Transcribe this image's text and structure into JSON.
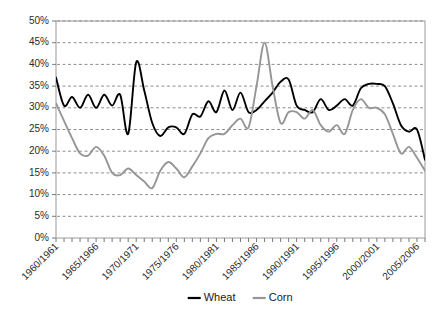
{
  "chart_data": {
    "type": "line",
    "title": "",
    "xlabel": "",
    "ylabel": "",
    "ylim": [
      0,
      50
    ],
    "y_tick_step": 5,
    "y_tick_labels": [
      "0%",
      "5%",
      "10%",
      "15%",
      "20%",
      "25%",
      "30%",
      "35%",
      "40%",
      "45%",
      "50%"
    ],
    "grid": true,
    "grid_style": "dashed-horizontal",
    "legend_position": "bottom-center",
    "x_tick_labels": [
      "1960/1961",
      "1965/1966",
      "1970/1971",
      "1975/1976",
      "1980/1981",
      "1985/1986",
      "1990/1991",
      "1995/1996",
      "2000/2001",
      "2005/2006"
    ],
    "x_tick_label_rotation": -45,
    "x_minor_tick_every": 1,
    "x": [
      "1960/1961",
      "1961/1962",
      "1962/1963",
      "1963/1964",
      "1964/1965",
      "1965/1966",
      "1966/1967",
      "1967/1968",
      "1968/1969",
      "1969/1970",
      "1970/1971",
      "1971/1972",
      "1972/1973",
      "1973/1974",
      "1974/1975",
      "1975/1976",
      "1976/1977",
      "1977/1978",
      "1978/1979",
      "1979/1980",
      "1980/1981",
      "1981/1982",
      "1982/1983",
      "1983/1984",
      "1984/1985",
      "1985/1986",
      "1986/1987",
      "1987/1988",
      "1988/1989",
      "1989/1990",
      "1990/1991",
      "1991/1992",
      "1992/1993",
      "1993/1994",
      "1994/1995",
      "1995/1996",
      "1996/1997",
      "1997/1998",
      "1998/1999",
      "1999/2000",
      "2000/2001",
      "2001/2002",
      "2002/2003",
      "2003/2004",
      "2004/2005",
      "2005/2006",
      "2006/2007"
    ],
    "series": [
      {
        "name": "Wheat",
        "color": "#000000",
        "values": [
          37.0,
          30.5,
          32.5,
          30.0,
          33.0,
          30.0,
          33.0,
          30.5,
          33.0,
          24.0,
          40.5,
          34.0,
          26.5,
          23.5,
          25.5,
          25.5,
          24.0,
          28.5,
          28.0,
          31.5,
          29.0,
          34.0,
          29.5,
          33.5,
          29.0,
          29.5,
          31.5,
          33.5,
          36.0,
          36.5,
          30.5,
          29.5,
          29.0,
          32.0,
          29.5,
          30.5,
          32.0,
          30.5,
          34.5,
          35.5,
          35.5,
          35.0,
          31.0,
          26.0,
          24.5,
          25.0,
          18.0
        ]
      },
      {
        "name": "Corn",
        "color": "#969696",
        "values": [
          31.0,
          27.0,
          23.0,
          19.5,
          19.0,
          21.0,
          19.0,
          15.0,
          14.5,
          16.0,
          14.5,
          13.0,
          11.5,
          15.5,
          17.5,
          16.0,
          14.0,
          16.5,
          19.5,
          23.0,
          24.0,
          24.0,
          26.0,
          27.5,
          25.5,
          35.0,
          45.0,
          35.0,
          26.5,
          29.0,
          29.0,
          27.5,
          29.5,
          26.0,
          24.5,
          26.0,
          24.0,
          29.5,
          32.0,
          30.0,
          30.0,
          28.5,
          24.0,
          19.5,
          21.0,
          18.5,
          15.5
        ]
      }
    ]
  },
  "legend": {
    "items": [
      {
        "label": "Wheat",
        "color": "#000000"
      },
      {
        "label": "Corn",
        "color": "#969696"
      }
    ]
  }
}
